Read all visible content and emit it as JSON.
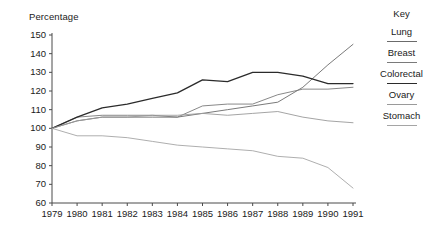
{
  "chart_data": {
    "type": "line",
    "title": "",
    "ylabel": "Percentage",
    "xlabel": "",
    "ylim": [
      60,
      150
    ],
    "ytick_step": 10,
    "grid": false,
    "legend_position": "right",
    "legend_title": "Key",
    "x": [
      1979,
      1980,
      1981,
      1982,
      1983,
      1984,
      1985,
      1986,
      1987,
      1988,
      1989,
      1990,
      1991
    ],
    "categories": [
      "1979",
      "1980",
      "1981",
      "1982",
      "1983",
      "1984",
      "1985",
      "1986",
      "1987",
      "1988",
      "1989",
      "1990",
      "1991"
    ],
    "yticks": [
      150,
      140,
      130,
      120,
      110,
      100,
      90,
      80,
      70,
      60
    ],
    "series": [
      {
        "name": "Lung",
        "color": "#6b6b6b",
        "values": [
          100,
          104,
          106,
          106,
          106,
          106,
          108,
          110,
          112,
          114,
          122,
          134,
          145
        ]
      },
      {
        "name": "Breast",
        "color": "#7a7a7a",
        "values": [
          100,
          106,
          107,
          107,
          107,
          106,
          112,
          113,
          113,
          118,
          121,
          121,
          122
        ]
      },
      {
        "name": "Colorectal",
        "color": "#2b2b2b",
        "values": [
          100,
          106,
          111,
          113,
          116,
          119,
          126,
          125,
          130,
          130,
          128,
          124,
          124
        ]
      },
      {
        "name": "Ovary",
        "color": "#9a9a9a",
        "values": [
          100,
          104,
          106,
          106,
          107,
          107,
          108,
          107,
          108,
          109,
          106,
          104,
          103
        ]
      },
      {
        "name": "Stomach",
        "color": "#a5a5a5",
        "values": [
          100,
          96,
          96,
          95,
          93,
          91,
          90,
          89,
          88,
          85,
          84,
          79,
          68
        ]
      }
    ]
  },
  "axis": {
    "y_title": "Percentage"
  },
  "legend": {
    "title": "Key",
    "items": [
      {
        "label": "Lung"
      },
      {
        "label": "Breast"
      },
      {
        "label": "Colorectal"
      },
      {
        "label": "Ovary"
      },
      {
        "label": "Stomach"
      }
    ]
  }
}
